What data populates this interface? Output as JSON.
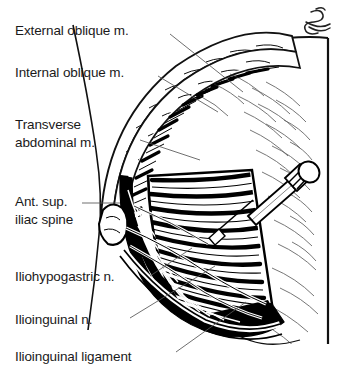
{
  "figure": {
    "style": "pen-and-ink medical illustration",
    "background_color": "#ffffff",
    "ink_color": "#000000",
    "width": 339,
    "height": 377
  },
  "labels": {
    "external_oblique": "External oblique m.",
    "internal_oblique": "Internal oblique m.",
    "transverse_abdominal_line1": "Transverse",
    "transverse_abdominal_line2": "abdominal m.",
    "asis_line1": "Ant. sup.",
    "asis_line2": "iliac spine",
    "iliohypogastric_nerve": "Iliohypogastric n.",
    "ilioinguinal_nerve": "Ilioinguinal n.",
    "ilioinguinal_ligament": "Ilioinguinal ligament"
  },
  "artist_monogram": {
    "present": true,
    "description": "script initials monogram, top right corner"
  },
  "anatomy": {
    "structures": [
      "external oblique muscle",
      "internal oblique muscle",
      "transverse abdominal muscle",
      "anterior superior iliac spine",
      "iliohypogastric nerve",
      "ilioinguinal nerve",
      "ilioinguinal ligament",
      "needle with syringe hub"
    ]
  }
}
